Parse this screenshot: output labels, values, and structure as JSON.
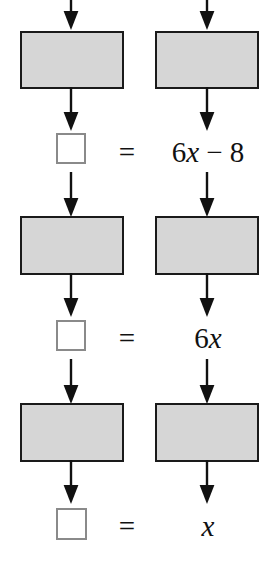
{
  "diagram": {
    "type": "flowchart-balance-steps",
    "colors": {
      "box_fill": "#d6d6d6",
      "box_border": "#1a1a1a",
      "square_border": "#8a8a8a",
      "square_fill": "#ffffff",
      "arrow": "#111111",
      "text": "#111111",
      "background": "#ffffff"
    },
    "columns": [
      {
        "name": "left-column",
        "label": "left-side"
      },
      {
        "name": "right-column",
        "label": "right-side"
      }
    ],
    "rows": [
      {
        "id": "row-1",
        "left_box_label": "",
        "right_box_label": "",
        "result_square_label": "",
        "equals": "=",
        "rhs_parts": [
          {
            "text": "6",
            "italic": false
          },
          {
            "text": "x",
            "italic": true
          },
          {
            "text": " − 8",
            "italic": false
          }
        ],
        "rhs_plain": "6x − 8"
      },
      {
        "id": "row-2",
        "left_box_label": "",
        "right_box_label": "",
        "result_square_label": "",
        "equals": "=",
        "rhs_parts": [
          {
            "text": "6",
            "italic": false
          },
          {
            "text": "x",
            "italic": true
          }
        ],
        "rhs_plain": "6x"
      },
      {
        "id": "row-3",
        "left_box_label": "",
        "right_box_label": "",
        "result_square_label": "",
        "equals": "=",
        "rhs_parts": [
          {
            "text": "x",
            "italic": true
          }
        ],
        "rhs_plain": "x"
      }
    ],
    "arrow_count": 12,
    "box_count": 6,
    "result_square_count": 3
  }
}
